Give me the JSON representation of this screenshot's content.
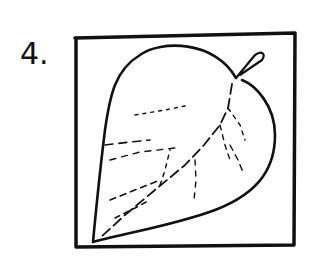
{
  "figure": {
    "label": "4.",
    "ink_color": "#111111",
    "background": "#ffffff"
  }
}
